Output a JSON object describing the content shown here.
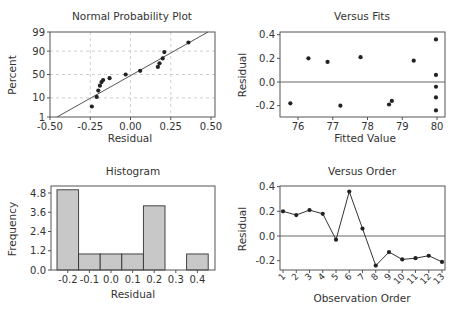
{
  "chart_data": [
    {
      "id": "npp",
      "type": "scatter",
      "title": "Normal Probability Plot",
      "xlabel": "Residual",
      "ylabel": "Percent",
      "xlim": [
        -0.5,
        0.5
      ],
      "xticks": [
        "-0.50",
        "-0.25",
        "0.00",
        "0.25",
        "0.50"
      ],
      "xtick_values": [
        -0.5,
        -0.25,
        0.0,
        0.25,
        0.5
      ],
      "yticks": [
        "1",
        "10",
        "50",
        "90",
        "99"
      ],
      "yscale": "normal-probability",
      "grid": true,
      "fit_line": true,
      "points": [
        {
          "x": -0.24,
          "y": 4
        },
        {
          "x": -0.21,
          "y": 11
        },
        {
          "x": -0.2,
          "y": 19
        },
        {
          "x": -0.19,
          "y": 27
        },
        {
          "x": -0.18,
          "y": 34
        },
        {
          "x": -0.17,
          "y": 38
        },
        {
          "x": -0.13,
          "y": 42
        },
        {
          "x": -0.03,
          "y": 50
        },
        {
          "x": 0.06,
          "y": 58
        },
        {
          "x": 0.17,
          "y": 66
        },
        {
          "x": 0.18,
          "y": 73
        },
        {
          "x": 0.2,
          "y": 81
        },
        {
          "x": 0.21,
          "y": 89
        },
        {
          "x": 0.36,
          "y": 96
        }
      ]
    },
    {
      "id": "fits",
      "type": "scatter",
      "title": "Versus Fits",
      "xlabel": "Fitted Value",
      "ylabel": "Residual",
      "xlim": [
        75.6,
        80.2
      ],
      "ylim": [
        -0.27,
        0.42
      ],
      "xticks": [
        "76",
        "77",
        "78",
        "79",
        "80"
      ],
      "xtick_values": [
        76,
        77,
        78,
        79,
        80
      ],
      "yticks": [
        "-0.2",
        "0.0",
        "0.2",
        "0.4"
      ],
      "ytick_values": [
        -0.2,
        0.0,
        0.2,
        0.4
      ],
      "reference_line": 0.0,
      "points": [
        {
          "x": 75.78,
          "y": -0.18
        },
        {
          "x": 76.3,
          "y": 0.2
        },
        {
          "x": 76.85,
          "y": 0.17
        },
        {
          "x": 77.22,
          "y": -0.2
        },
        {
          "x": 77.8,
          "y": 0.21
        },
        {
          "x": 78.62,
          "y": -0.19
        },
        {
          "x": 78.7,
          "y": -0.16
        },
        {
          "x": 79.33,
          "y": 0.18
        },
        {
          "x": 79.97,
          "y": 0.36
        },
        {
          "x": 79.97,
          "y": 0.06
        },
        {
          "x": 79.97,
          "y": -0.04
        },
        {
          "x": 79.97,
          "y": -0.13
        },
        {
          "x": 79.97,
          "y": -0.24
        }
      ]
    },
    {
      "id": "hist",
      "type": "bar",
      "title": "Histogram",
      "xlabel": "Residual",
      "ylabel": "Frequency",
      "categories": [
        "-0.2",
        "-0.1",
        "0.0",
        "0.1",
        "0.2",
        "0.3",
        "0.4"
      ],
      "values": [
        5,
        1,
        1,
        1,
        4,
        0,
        1
      ],
      "ylim": [
        0,
        5.2
      ],
      "yticks": [
        "0.0",
        "1.2",
        "2.4",
        "3.6",
        "4.8"
      ],
      "ytick_values": [
        0,
        1.2,
        2.4,
        3.6,
        4.8
      ],
      "bar_color": "#c8c8c8"
    },
    {
      "id": "order",
      "type": "line",
      "title": "Versus Order",
      "xlabel": "Observation Order",
      "ylabel": "Residual",
      "x": [
        1,
        2,
        3,
        4,
        5,
        6,
        7,
        8,
        9,
        10,
        11,
        12,
        13
      ],
      "values": [
        0.2,
        0.17,
        0.21,
        0.18,
        -0.03,
        0.36,
        0.06,
        -0.24,
        -0.13,
        -0.19,
        -0.18,
        -0.16,
        -0.21
      ],
      "ylim": [
        -0.27,
        0.42
      ],
      "yticks": [
        "-0.2",
        "0.0",
        "0.2",
        "0.4"
      ],
      "ytick_values": [
        -0.2,
        0.0,
        0.2,
        0.4
      ],
      "xticks": [
        "1",
        "2",
        "3",
        "4",
        "5",
        "6",
        "7",
        "8",
        "9",
        "10",
        "11",
        "12",
        "13"
      ],
      "reference_line": 0.0
    }
  ]
}
